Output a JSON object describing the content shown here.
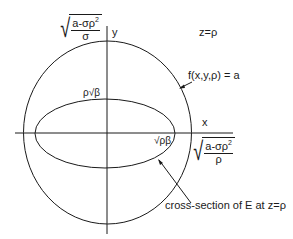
{
  "diagram": {
    "axes": {
      "x_label": "x",
      "y_label": "y"
    },
    "plane_label": "z=ρ",
    "outer_curve_label": "f(x,y,ρ) = a",
    "inner_curve_label": "cross-section of E at z=ρ",
    "y_intercept_outer": {
      "numerator": "a-σρ",
      "exp": "2",
      "denominator": "σ"
    },
    "x_intercept_outer": {
      "numerator": "a-σρ",
      "exp": "2",
      "denominator": "ρ"
    },
    "y_intercept_inner": "ρ√β",
    "x_intercept_inner": "√ρβ",
    "colors": {
      "stroke": "#1a1a1a",
      "background": "#ffffff"
    }
  }
}
